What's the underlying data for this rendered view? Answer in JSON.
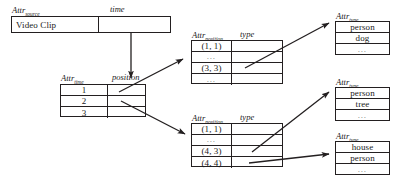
{
  "figure": {
    "line_color": "#231f20",
    "text_color": "#1a1a1a",
    "background": "#ffffff"
  },
  "source_table": {
    "header_attr": "Attr",
    "header_sub": "source",
    "column2_label": "time",
    "rows": [
      {
        "source": "Video Clip",
        "time": ""
      }
    ]
  },
  "time_table": {
    "header_attr": "Attr",
    "header_sub": "time",
    "column2_label": "position",
    "rows": [
      {
        "time": "1",
        "position": ""
      },
      {
        "time": "2",
        "position": ""
      },
      {
        "time": "3",
        "position": ""
      }
    ]
  },
  "position_table_upper": {
    "header_attr": "Attr",
    "header_sub": "position",
    "column2_label": "type",
    "rows": [
      {
        "position": "(1, 1)",
        "type": ""
      },
      {
        "position": "...",
        "type": ""
      },
      {
        "position": "(3, 3)",
        "type": ""
      },
      {
        "position": "...",
        "type": ""
      }
    ]
  },
  "position_table_lower": {
    "header_attr": "Attr",
    "header_sub": "position",
    "column2_label": "type",
    "rows": [
      {
        "position": "(1, 1)",
        "type": ""
      },
      {
        "position": "...",
        "type": ""
      },
      {
        "position": "(4, 3)",
        "type": ""
      },
      {
        "position": "(4, 4)",
        "type": ""
      }
    ]
  },
  "type_table_top": {
    "header_attr": "Attr",
    "header_sub": "type",
    "rows": [
      {
        "type": "person"
      },
      {
        "type": "dog"
      },
      {
        "type": "..."
      }
    ]
  },
  "type_table_middle": {
    "header_attr": "Attr",
    "header_sub": "type",
    "rows": [
      {
        "type": "person"
      },
      {
        "type": "tree"
      },
      {
        "type": "..."
      }
    ]
  },
  "type_table_bottom": {
    "header_attr": "Attr",
    "header_sub": "type",
    "rows": [
      {
        "type": "house"
      },
      {
        "type": "person"
      },
      {
        "type": "..."
      }
    ]
  }
}
